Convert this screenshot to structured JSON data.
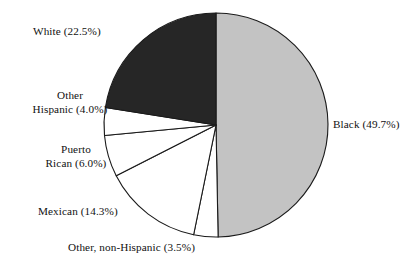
{
  "chart_data": {
    "type": "pie",
    "title": "",
    "subtitle": "",
    "xlabel": "",
    "ylabel": "",
    "legend_position": "none",
    "grid": false,
    "start_angle_deg": 0,
    "direction": "clockwise",
    "center": {
      "x": 216,
      "y": 125
    },
    "radius": 112,
    "categories": [
      "Black",
      "Other, non-Hispanic",
      "Mexican",
      "Puerto Rican",
      "Other Hispanic",
      "White"
    ],
    "values": [
      49.7,
      3.5,
      14.3,
      6.0,
      4.0,
      22.5
    ],
    "units": "percent",
    "slices": [
      {
        "name": "Black",
        "value": 49.7,
        "label": "Black (49.7%)",
        "label_lines": [
          "Black (49.7%)"
        ],
        "fill": "#c3c3c3",
        "stroke": "#1a1a1a"
      },
      {
        "name": "Other, non-Hispanic",
        "value": 3.5,
        "label": "Other, non-Hispanic (3.5%)",
        "label_lines": [
          "Other, non-Hispanic (3.5%)"
        ],
        "fill": "#ffffff",
        "stroke": "#1a1a1a"
      },
      {
        "name": "Mexican",
        "value": 14.3,
        "label": "Mexican (14.3%)",
        "label_lines": [
          "Mexican (14.3%)"
        ],
        "fill": "#ffffff",
        "stroke": "#1a1a1a"
      },
      {
        "name": "Puerto Rican",
        "value": 6.0,
        "label": "Puerto Rican (6.0%)",
        "label_lines": [
          "Puerto",
          "Rican (6.0%)"
        ],
        "fill": "#ffffff",
        "stroke": "#1a1a1a"
      },
      {
        "name": "Other Hispanic",
        "value": 4.0,
        "label": "Other Hispanic (4.0%)",
        "label_lines": [
          "Other",
          "Hispanic (4.0%)"
        ],
        "fill": "#ffffff",
        "stroke": "#1a1a1a"
      },
      {
        "name": "White",
        "value": 22.5,
        "label": "White (22.5%)",
        "label_lines": [
          "White (22.5%)"
        ],
        "fill": "#262626",
        "stroke": "#1a1a1a"
      }
    ]
  },
  "labels": {
    "white": "White (22.5%)",
    "other_hispanic_line1": "Other",
    "other_hispanic_line2": "Hispanic (4.0%)",
    "puerto_rican_line1": "Puerto",
    "puerto_rican_line2": "Rican (6.0%)",
    "mexican": "Mexican (14.3%)",
    "other_non_hispanic": "Other, non-Hispanic (3.5%)",
    "black": "Black (49.7%)"
  },
  "colors": {
    "background": "#ffffff",
    "slice_black": "#c3c3c3",
    "slice_white": "#262626",
    "slice_empty": "#ffffff",
    "outline": "#1a1a1a",
    "text": "#111111"
  }
}
